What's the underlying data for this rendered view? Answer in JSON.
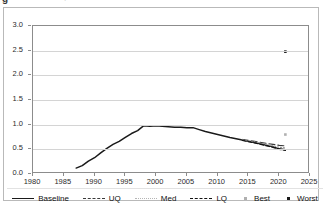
{
  "chart_data": {
    "type": "line",
    "title": "",
    "subtitle": "",
    "xlabel": "",
    "ylabel": "",
    "xlim": [
      1980,
      2025
    ],
    "ylim": [
      0.0,
      3.0
    ],
    "grid": true,
    "gridlines": "horizontal",
    "legend_position": "bottom",
    "x_ticks": [
      "1980",
      "1985",
      "1990",
      "1995",
      "2000",
      "2005",
      "2010",
      "2015",
      "2020",
      "2025"
    ],
    "x_tick_values": [
      1980,
      1985,
      1990,
      1995,
      2000,
      2005,
      2010,
      2015,
      2020,
      2025
    ],
    "y_ticks": [
      "0.0",
      "0.5",
      "1.0",
      "1.5",
      "2.0",
      "2.5",
      "3.0"
    ],
    "y_tick_values": [
      0.0,
      0.5,
      1.0,
      1.5,
      2.0,
      2.5,
      3.0
    ],
    "series": [
      {
        "name": "Baseline",
        "style": "solid",
        "color": "#1a1a1a",
        "x": [
          1987,
          1988,
          1989,
          1990,
          1991,
          1992,
          1993,
          1994,
          1995,
          1996,
          1997,
          1998,
          1999,
          2000,
          2001,
          2002,
          2003,
          2004,
          2005,
          2006,
          2007,
          2008,
          2010,
          2012,
          2014,
          2016,
          2018,
          2019,
          2020,
          2021
        ],
        "values": [
          0.12,
          0.17,
          0.26,
          0.33,
          0.43,
          0.52,
          0.6,
          0.66,
          0.74,
          0.82,
          0.88,
          0.98,
          0.97,
          0.98,
          0.97,
          0.96,
          0.95,
          0.95,
          0.94,
          0.94,
          0.9,
          0.86,
          0.8,
          0.74,
          0.69,
          0.64,
          0.58,
          0.55,
          0.51,
          0.49
        ]
      },
      {
        "name": "UQ",
        "style": "long-dash",
        "color": "#3a3a3a",
        "x": [
          2014,
          2016,
          2018,
          2019,
          2020,
          2021
        ],
        "values": [
          0.7,
          0.66,
          0.62,
          0.6,
          0.58,
          0.57
        ]
      },
      {
        "name": "Med",
        "style": "fine-dot",
        "color": "#9a9a9a",
        "x": [
          2014,
          2016,
          2018,
          2019,
          2020,
          2021
        ],
        "values": [
          0.69,
          0.65,
          0.6,
          0.57,
          0.54,
          0.53
        ]
      },
      {
        "name": "LQ",
        "style": "dash-dash",
        "color": "#111111",
        "x": [
          2014,
          2016,
          2018,
          2019,
          2020,
          2021
        ],
        "values": [
          0.68,
          0.63,
          0.57,
          0.54,
          0.5,
          0.48
        ]
      }
    ],
    "point_series": [
      {
        "name": "Best",
        "marker": "dot",
        "color": "#b0b0b0",
        "points": [
          {
            "x": 2021,
            "y": 0.8
          }
        ]
      },
      {
        "name": "Worst",
        "marker": "dot",
        "color": "#1a1a1a",
        "points": [
          {
            "x": 2021,
            "y": 2.48
          }
        ]
      }
    ]
  },
  "legend": {
    "items": [
      {
        "label": "Baseline",
        "kind": "line",
        "style": "solid",
        "color": "#1a1a1a"
      },
      {
        "label": "UQ",
        "kind": "line",
        "style": "long-dash",
        "color": "#3a3a3a"
      },
      {
        "label": "Med",
        "kind": "line",
        "style": "fine-dot",
        "color": "#b5b5b5"
      },
      {
        "label": "LQ",
        "kind": "line",
        "style": "dash-dash",
        "color": "#111111"
      },
      {
        "label": "Best",
        "kind": "marker",
        "style": "dot",
        "color": "#b0b0b0"
      },
      {
        "label": "Worst",
        "kind": "marker",
        "style": "dot",
        "color": "#1a1a1a"
      }
    ]
  },
  "artifact": {
    "top_fragment": "g",
    "top_fragment_right": "."
  }
}
